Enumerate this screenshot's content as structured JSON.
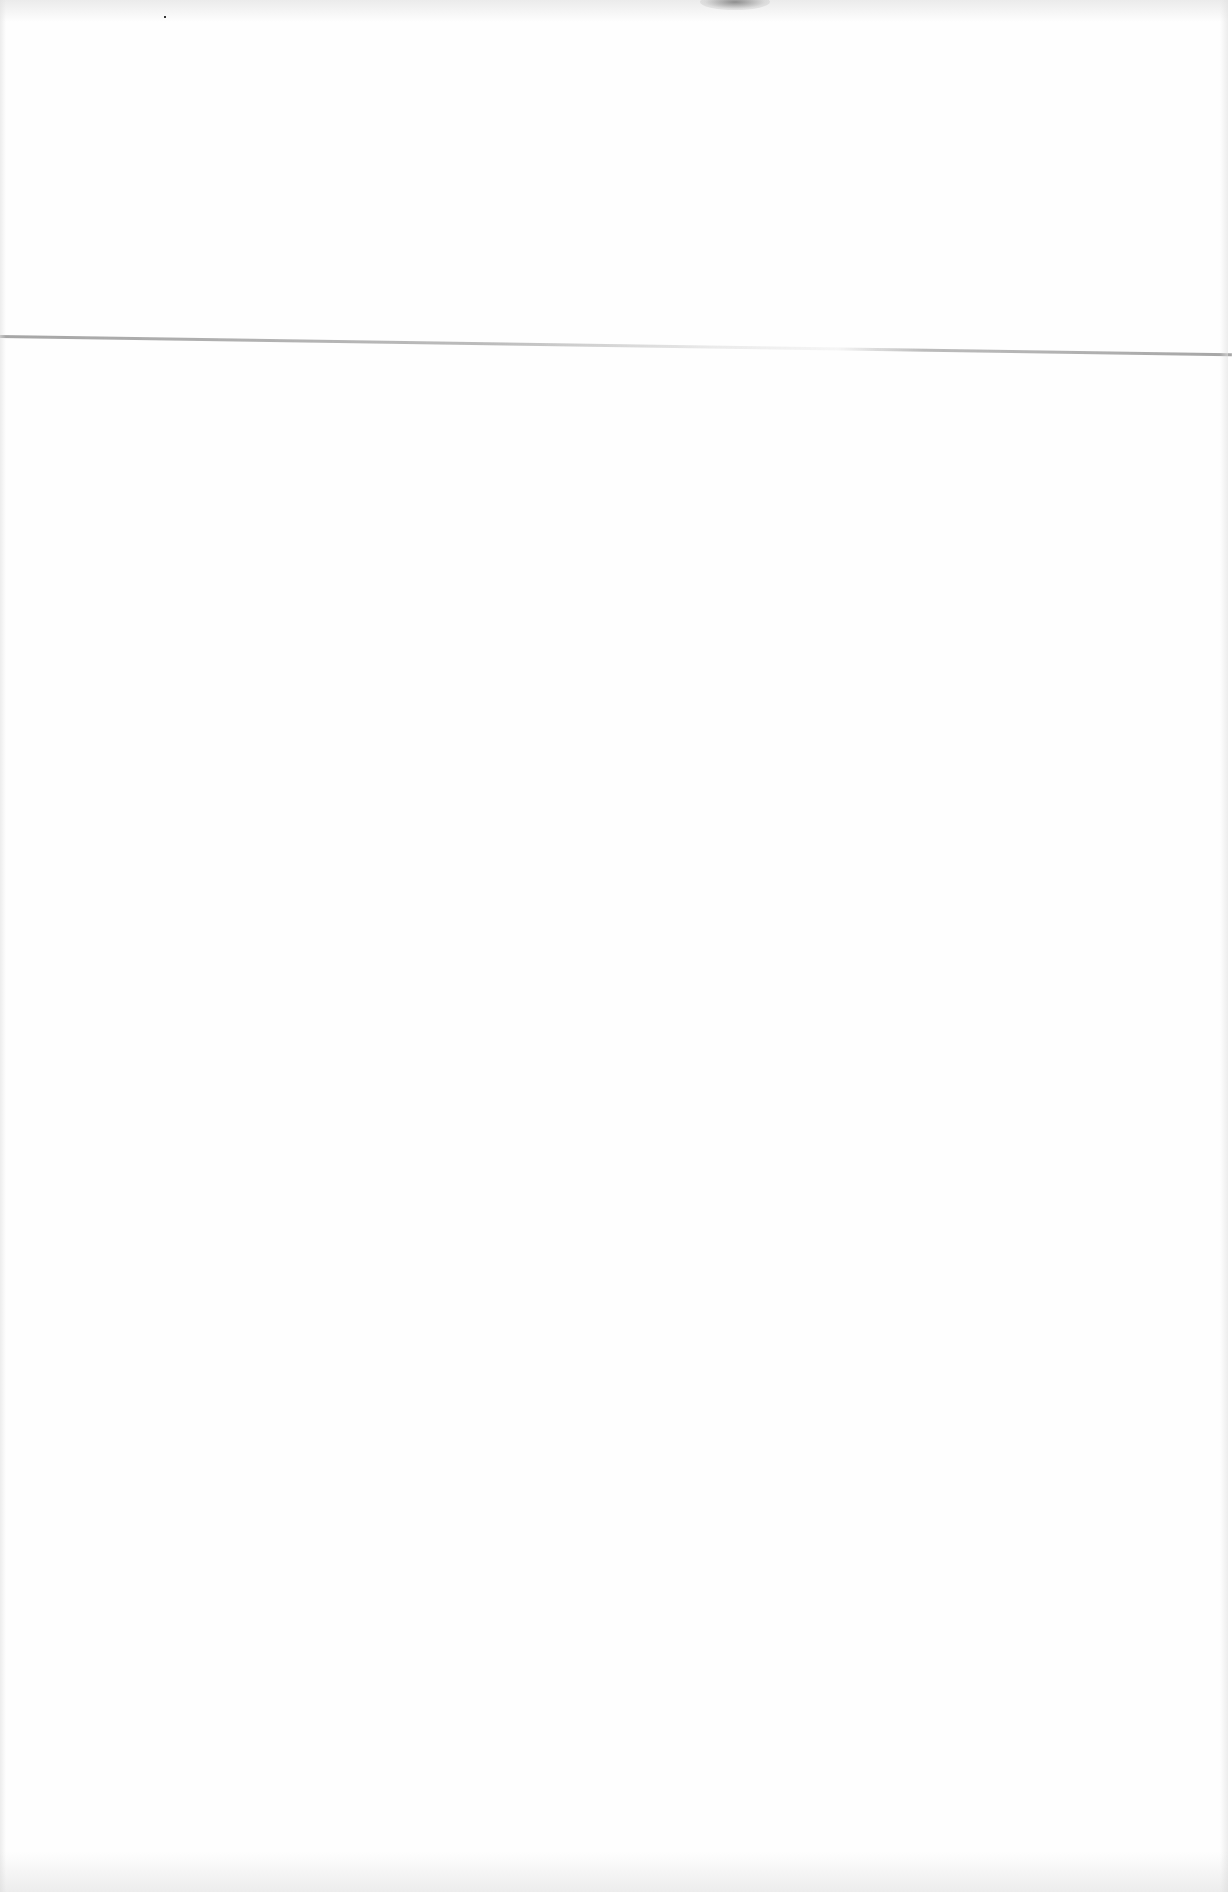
{
  "document": {
    "type": "blank scanned page",
    "text_content": [],
    "colors": {
      "paper": "#fefefe",
      "fold_line": "#969696",
      "smudge": "#6e6e6e"
    }
  }
}
